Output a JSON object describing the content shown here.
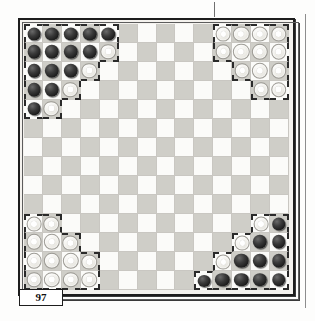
{
  "document": {
    "page_number": "97",
    "figure_type": "board-diagram"
  },
  "board": {
    "columns": 14,
    "rows": 14,
    "light_square_color": "#fbfbf9",
    "dark_square_color": "#cfcec8",
    "dark_piece_color": "#1a1a1a",
    "light_piece_color": "#f2f1ec",
    "territory_outline_color": "#2a2a2a",
    "piece_counts": {
      "dark_top_left": 16,
      "light_top_right": 13,
      "light_bottom_left": 13,
      "dark_bottom_right": 16
    },
    "pieces": [
      {
        "row": 1,
        "col": 1,
        "color": "dark"
      },
      {
        "row": 1,
        "col": 2,
        "color": "dark"
      },
      {
        "row": 1,
        "col": 3,
        "color": "dark"
      },
      {
        "row": 1,
        "col": 4,
        "color": "dark"
      },
      {
        "row": 1,
        "col": 5,
        "color": "dark"
      },
      {
        "row": 2,
        "col": 1,
        "color": "dark"
      },
      {
        "row": 2,
        "col": 2,
        "color": "dark"
      },
      {
        "row": 2,
        "col": 3,
        "color": "dark"
      },
      {
        "row": 2,
        "col": 4,
        "color": "dark"
      },
      {
        "row": 2,
        "col": 5,
        "color": "light"
      },
      {
        "row": 3,
        "col": 1,
        "color": "dark"
      },
      {
        "row": 3,
        "col": 2,
        "color": "dark"
      },
      {
        "row": 3,
        "col": 3,
        "color": "dark"
      },
      {
        "row": 3,
        "col": 4,
        "color": "light"
      },
      {
        "row": 4,
        "col": 1,
        "color": "dark"
      },
      {
        "row": 4,
        "col": 2,
        "color": "dark"
      },
      {
        "row": 4,
        "col": 3,
        "color": "light"
      },
      {
        "row": 5,
        "col": 1,
        "color": "dark"
      },
      {
        "row": 5,
        "col": 2,
        "color": "light"
      },
      {
        "row": 1,
        "col": 11,
        "color": "light"
      },
      {
        "row": 1,
        "col": 12,
        "color": "light"
      },
      {
        "row": 1,
        "col": 13,
        "color": "light"
      },
      {
        "row": 1,
        "col": 14,
        "color": "light"
      },
      {
        "row": 2,
        "col": 11,
        "color": "light"
      },
      {
        "row": 2,
        "col": 12,
        "color": "light"
      },
      {
        "row": 2,
        "col": 13,
        "color": "light"
      },
      {
        "row": 2,
        "col": 14,
        "color": "light"
      },
      {
        "row": 3,
        "col": 12,
        "color": "light"
      },
      {
        "row": 3,
        "col": 13,
        "color": "light"
      },
      {
        "row": 3,
        "col": 14,
        "color": "light"
      },
      {
        "row": 4,
        "col": 13,
        "color": "light"
      },
      {
        "row": 4,
        "col": 14,
        "color": "light"
      },
      {
        "row": 11,
        "col": 1,
        "color": "light"
      },
      {
        "row": 11,
        "col": 2,
        "color": "light"
      },
      {
        "row": 12,
        "col": 1,
        "color": "light"
      },
      {
        "row": 12,
        "col": 2,
        "color": "light"
      },
      {
        "row": 12,
        "col": 3,
        "color": "light"
      },
      {
        "row": 13,
        "col": 1,
        "color": "light"
      },
      {
        "row": 13,
        "col": 2,
        "color": "light"
      },
      {
        "row": 13,
        "col": 3,
        "color": "light"
      },
      {
        "row": 13,
        "col": 4,
        "color": "light"
      },
      {
        "row": 14,
        "col": 1,
        "color": "light"
      },
      {
        "row": 14,
        "col": 2,
        "color": "light"
      },
      {
        "row": 14,
        "col": 3,
        "color": "light"
      },
      {
        "row": 14,
        "col": 4,
        "color": "light"
      },
      {
        "row": 11,
        "col": 13,
        "color": "light"
      },
      {
        "row": 11,
        "col": 14,
        "color": "dark"
      },
      {
        "row": 12,
        "col": 12,
        "color": "light"
      },
      {
        "row": 12,
        "col": 13,
        "color": "dark"
      },
      {
        "row": 12,
        "col": 14,
        "color": "dark"
      },
      {
        "row": 13,
        "col": 11,
        "color": "light"
      },
      {
        "row": 13,
        "col": 12,
        "color": "dark"
      },
      {
        "row": 13,
        "col": 13,
        "color": "dark"
      },
      {
        "row": 13,
        "col": 14,
        "color": "dark"
      },
      {
        "row": 14,
        "col": 10,
        "color": "dark"
      },
      {
        "row": 14,
        "col": 11,
        "color": "dark"
      },
      {
        "row": 14,
        "col": 12,
        "color": "dark"
      },
      {
        "row": 14,
        "col": 13,
        "color": "dark"
      },
      {
        "row": 14,
        "col": 14,
        "color": "dark"
      }
    ],
    "territories": [
      {
        "name": "top-left-home",
        "cells": [
          [
            1,
            1
          ],
          [
            1,
            2
          ],
          [
            1,
            3
          ],
          [
            1,
            4
          ],
          [
            1,
            5
          ],
          [
            2,
            1
          ],
          [
            2,
            2
          ],
          [
            2,
            3
          ],
          [
            2,
            4
          ],
          [
            2,
            5
          ],
          [
            3,
            1
          ],
          [
            3,
            2
          ],
          [
            3,
            3
          ],
          [
            3,
            4
          ],
          [
            4,
            1
          ],
          [
            4,
            2
          ],
          [
            4,
            3
          ],
          [
            5,
            1
          ],
          [
            5,
            2
          ]
        ]
      },
      {
        "name": "top-right-home",
        "cells": [
          [
            1,
            11
          ],
          [
            1,
            12
          ],
          [
            1,
            13
          ],
          [
            1,
            14
          ],
          [
            2,
            11
          ],
          [
            2,
            12
          ],
          [
            2,
            13
          ],
          [
            2,
            14
          ],
          [
            3,
            12
          ],
          [
            3,
            13
          ],
          [
            3,
            14
          ],
          [
            4,
            13
          ],
          [
            4,
            14
          ]
        ]
      },
      {
        "name": "bottom-left-home",
        "cells": [
          [
            11,
            1
          ],
          [
            11,
            2
          ],
          [
            12,
            1
          ],
          [
            12,
            2
          ],
          [
            12,
            3
          ],
          [
            13,
            1
          ],
          [
            13,
            2
          ],
          [
            13,
            3
          ],
          [
            13,
            4
          ],
          [
            14,
            1
          ],
          [
            14,
            2
          ],
          [
            14,
            3
          ],
          [
            14,
            4
          ]
        ]
      },
      {
        "name": "bottom-right-home",
        "cells": [
          [
            11,
            13
          ],
          [
            11,
            14
          ],
          [
            12,
            12
          ],
          [
            12,
            13
          ],
          [
            12,
            14
          ],
          [
            13,
            11
          ],
          [
            13,
            12
          ],
          [
            13,
            13
          ],
          [
            13,
            14
          ],
          [
            14,
            10
          ],
          [
            14,
            11
          ],
          [
            14,
            12
          ],
          [
            14,
            13
          ],
          [
            14,
            14
          ]
        ]
      }
    ]
  }
}
